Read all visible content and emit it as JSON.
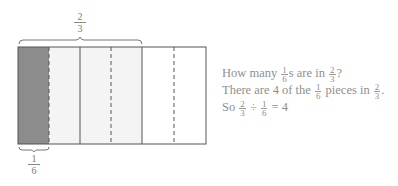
{
  "diagram": {
    "top_label": {
      "num": "2",
      "den": "3"
    },
    "bottom_label": {
      "num": "1",
      "den": "6"
    },
    "rect": {
      "x": 18,
      "y": 47,
      "width": 188,
      "height": 97
    },
    "pieces": 6,
    "shaded_dark_piece_index": 0,
    "shaded_light_piece_indices": [
      1,
      2,
      3
    ],
    "dark_fill": "#8c8c8c",
    "light_fill": "#f4f4f4",
    "stroke": "#555555"
  },
  "text": {
    "line1": {
      "a": "How many ",
      "f1": {
        "num": "1",
        "den": "6"
      },
      "b": "s are in ",
      "f2": {
        "num": "2",
        "den": "3"
      },
      "c": "?"
    },
    "line2": {
      "a": "There are 4 of the ",
      "f1": {
        "num": "1",
        "den": "6"
      },
      "b": " pieces in ",
      "f2": {
        "num": "2",
        "den": "3"
      },
      "c": "."
    },
    "line3": {
      "a": "So ",
      "f1": {
        "num": "2",
        "den": "3"
      },
      "b": " ÷ ",
      "f2": {
        "num": "1",
        "den": "6"
      },
      "c": " = 4"
    }
  }
}
